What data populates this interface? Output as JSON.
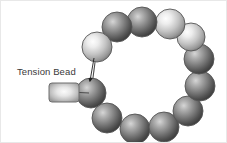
{
  "figure": {
    "background_color": "#ffffff",
    "width": 227,
    "height": 143
  },
  "annotation": {
    "label": "Tension Bead",
    "label_x": 16,
    "label_y": 74,
    "pointer_from_x": 93,
    "pointer_from_y": 57,
    "pointer_to_x": 89,
    "pointer_to_y": 80
  },
  "tension_bead": {
    "name": "tension-bead",
    "shape": "rounded-rect",
    "x": 48,
    "y": 82,
    "width": 30,
    "height": 19,
    "corner_radius": 3,
    "fill_center": "#f2f2f2",
    "fill_edge": "#9a9a9a",
    "stroke": "#6e6e6e",
    "connector_to_x": 88,
    "connector_to_y": 92
  },
  "ring": {
    "name": "bead-ring",
    "center_x": 152,
    "center_y": 73,
    "radius": 47,
    "bead_radius": 15,
    "bead_count": 12,
    "stroke": "#555555",
    "thread_color": "#4a4a4a",
    "beads": [
      {
        "index": 0,
        "cx": 90,
        "cy": 92,
        "r": 15,
        "tone": "dark",
        "center": "#a8a8a8",
        "edge": "#3c3c3c"
      },
      {
        "index": 1,
        "cx": 106,
        "cy": 117,
        "r": 15,
        "tone": "dark",
        "center": "#b4b4b4",
        "edge": "#454545"
      },
      {
        "index": 2,
        "cx": 134,
        "cy": 128,
        "r": 15,
        "tone": "dark",
        "center": "#b0b0b0",
        "edge": "#3f3f3f"
      },
      {
        "index": 3,
        "cx": 163,
        "cy": 126,
        "r": 15,
        "tone": "dark",
        "center": "#b0b0b0",
        "edge": "#3f3f3f"
      },
      {
        "index": 4,
        "cx": 187,
        "cy": 110,
        "r": 15,
        "tone": "dark",
        "center": "#b4b4b4",
        "edge": "#454545"
      },
      {
        "index": 5,
        "cx": 199,
        "cy": 85,
        "r": 15,
        "tone": "dark",
        "center": "#b8b8b8",
        "edge": "#484848"
      },
      {
        "index": 6,
        "cx": 198,
        "cy": 58,
        "r": 15,
        "tone": "dark",
        "center": "#b4b4b4",
        "edge": "#434343"
      },
      {
        "index": 7,
        "cx": 190,
        "cy": 36,
        "r": 14,
        "tone": "light",
        "center": "#e4e4e4",
        "edge": "#6e6e6e"
      },
      {
        "index": 8,
        "cx": 169,
        "cy": 23,
        "r": 15,
        "tone": "light",
        "center": "#e0e0e0",
        "edge": "#6a6a6a"
      },
      {
        "index": 9,
        "cx": 141,
        "cy": 21,
        "r": 15,
        "tone": "dark",
        "center": "#aeaeae",
        "edge": "#3c3c3c"
      },
      {
        "index": 10,
        "cx": 116,
        "cy": 26,
        "r": 15,
        "tone": "dark",
        "center": "#a8a8a8",
        "edge": "#383838"
      },
      {
        "index": 11,
        "cx": 96,
        "cy": 46,
        "r": 15,
        "tone": "light",
        "center": "#f0f0f0",
        "edge": "#787878"
      }
    ],
    "threads": [
      {
        "from": 0,
        "to": 1
      },
      {
        "from": 1,
        "to": 2
      },
      {
        "from": 2,
        "to": 3
      },
      {
        "from": 3,
        "to": 4
      },
      {
        "from": 4,
        "to": 5
      },
      {
        "from": 5,
        "to": 6
      },
      {
        "from": 6,
        "to": 7
      },
      {
        "from": 7,
        "to": 8
      },
      {
        "from": 8,
        "to": 9
      },
      {
        "from": 9,
        "to": 10
      },
      {
        "from": 10,
        "to": 11
      },
      {
        "from": 11,
        "to": 0
      }
    ]
  }
}
